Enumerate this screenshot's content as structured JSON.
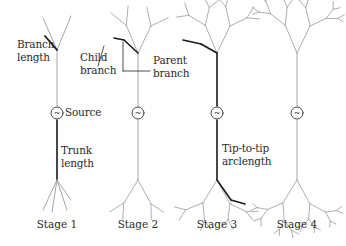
{
  "figure": {
    "colors": {
      "light_branch": "#9a9a9a",
      "highlight": "#1a1a1a",
      "text": "#2b2b2b",
      "background": "#ffffff"
    },
    "source_symbol": "~",
    "stages": [
      {
        "label": "Stage 1",
        "x": 57
      },
      {
        "label": "Stage 2",
        "x": 138
      },
      {
        "label": "Stage 3",
        "x": 217
      },
      {
        "label": "Stage 4",
        "x": 297
      }
    ],
    "annotations": {
      "branch_length": [
        "Branch",
        "length"
      ],
      "child_branch": [
        "Child",
        "branch"
      ],
      "parent_branch": [
        "Parent",
        "branch"
      ],
      "source": "Source",
      "trunk_length": [
        "Trunk",
        "length"
      ],
      "tip_to_tip": [
        "Tip-to-tip",
        "arclength"
      ]
    }
  }
}
